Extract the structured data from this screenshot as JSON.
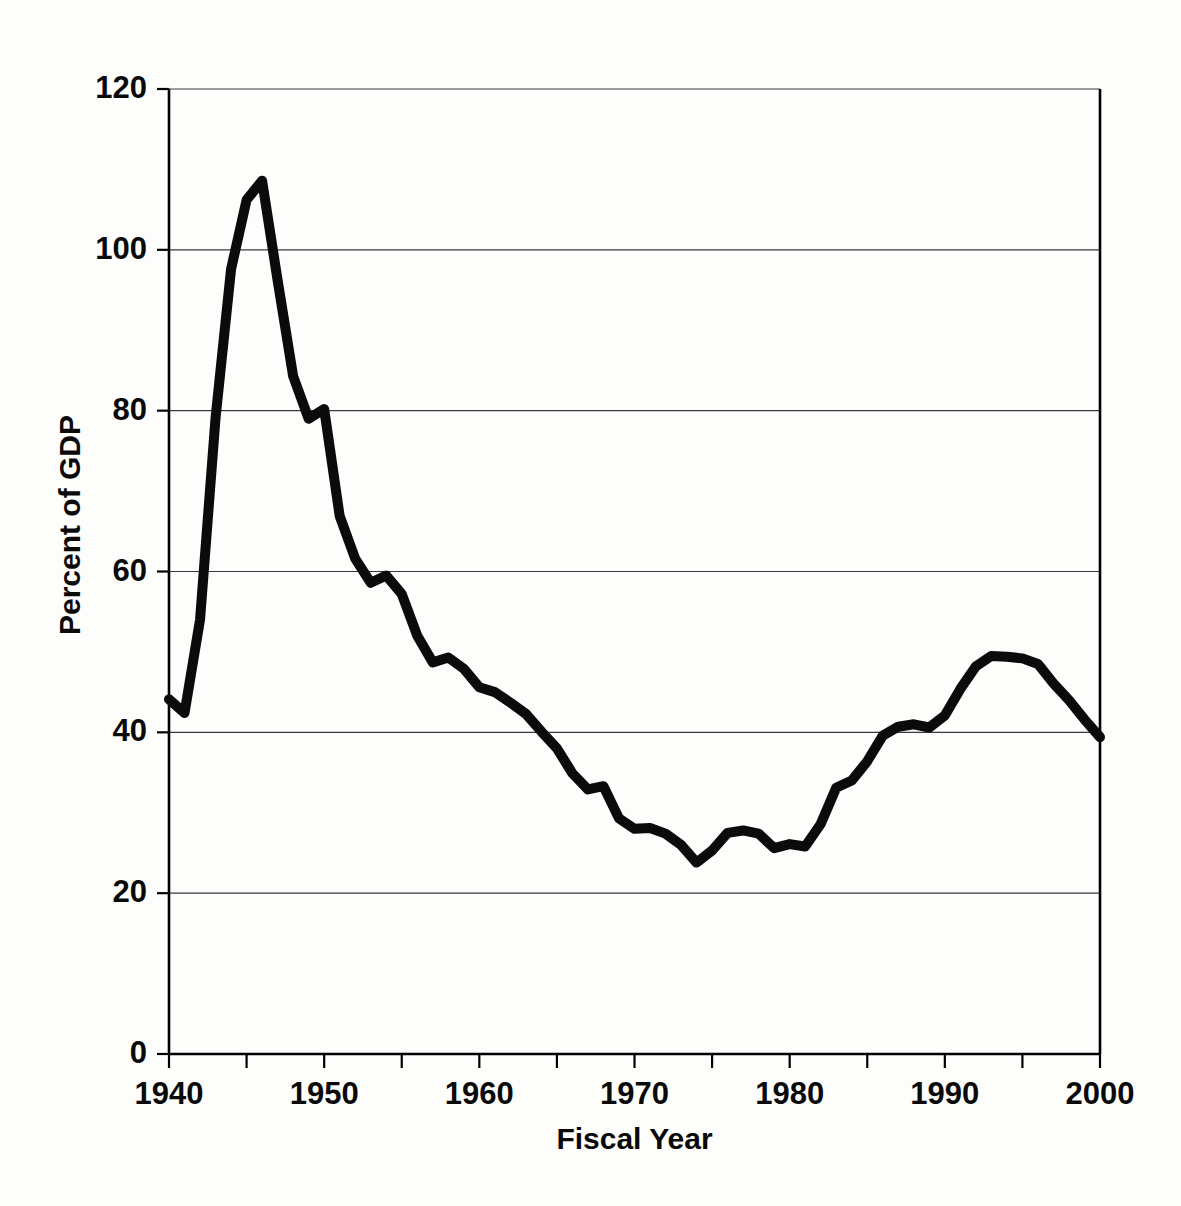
{
  "background": {
    "paper_color": "#fdfdfc",
    "bleed_through_lines": [
      "                                                                          ",
      "                                                                          "
    ]
  },
  "chart_data": {
    "type": "line",
    "title": "",
    "xlabel": "Fiscal Year",
    "ylabel": "Percent of GDP",
    "xlim": [
      1940,
      2000
    ],
    "ylim": [
      0,
      120
    ],
    "grid": true,
    "legend": false,
    "line_color": "#0b0b0b",
    "xticks": [
      1940,
      1945,
      1950,
      1955,
      1960,
      1965,
      1970,
      1975,
      1980,
      1985,
      1990,
      1995,
      2000
    ],
    "xtick_labels": [
      "1940",
      "",
      "1950",
      "",
      "1960",
      "",
      "1970",
      "",
      "1980",
      "",
      "1990",
      "",
      "2000"
    ],
    "xtick_labeled": [
      1940,
      1950,
      1960,
      1970,
      1980,
      1990,
      2000
    ],
    "yticks": [
      0,
      20,
      40,
      60,
      80,
      100,
      120
    ],
    "ytick_labels": [
      "0",
      "20",
      "40",
      "60",
      "80",
      "100",
      "120"
    ],
    "x": [
      1940,
      1941,
      1942,
      1943,
      1944,
      1945,
      1946,
      1947,
      1948,
      1949,
      1950,
      1951,
      1952,
      1953,
      1954,
      1955,
      1956,
      1957,
      1958,
      1959,
      1960,
      1961,
      1962,
      1963,
      1964,
      1965,
      1966,
      1967,
      1968,
      1969,
      1970,
      1971,
      1972,
      1973,
      1974,
      1975,
      1976,
      1977,
      1978,
      1979,
      1980,
      1981,
      1982,
      1983,
      1984,
      1985,
      1986,
      1987,
      1988,
      1989,
      1990,
      1991,
      1992,
      1993,
      1994,
      1995,
      1996,
      1997,
      1998,
      1999,
      2000
    ],
    "values": [
      44.1,
      42.4,
      54.0,
      79.1,
      97.6,
      106.2,
      108.6,
      96.2,
      84.3,
      79.0,
      80.2,
      66.9,
      61.6,
      58.6,
      59.5,
      57.2,
      52.0,
      48.7,
      49.3,
      47.9,
      45.6,
      45.0,
      43.7,
      42.3,
      40.1,
      38.0,
      34.9,
      32.9,
      33.3,
      29.3,
      28.0,
      28.1,
      27.4,
      26.0,
      23.8,
      25.3,
      27.5,
      27.8,
      27.4,
      25.6,
      26.1,
      25.8,
      28.6,
      33.1,
      34.0,
      36.4,
      39.6,
      40.7,
      41.0,
      40.6,
      42.1,
      45.4,
      48.2,
      49.5,
      49.4,
      49.2,
      48.5,
      46.1,
      44.0,
      41.6,
      39.4
    ],
    "annotations": []
  },
  "axis_labels": {
    "y_title": "Percent of GDP",
    "x_title": "Fiscal Year"
  }
}
